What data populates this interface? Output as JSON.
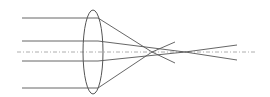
{
  "diagram": {
    "type": "optics-ray-diagram",
    "colors": {
      "background": "#ffffff",
      "ray": "#555555",
      "lens": "#555555",
      "axis": "#999999"
    },
    "axis": {
      "y": 52,
      "x1": 17,
      "x2": 256,
      "style": "dash-dot"
    },
    "lens": {
      "cx": 93,
      "cy": 52,
      "rx": 10,
      "ry": 42
    },
    "rays": [
      {
        "name": "outer-top",
        "y_in": 18,
        "x_lens": 98,
        "focus_x": 152,
        "end_x": 175,
        "end_y": 63
      },
      {
        "name": "inner-top",
        "y_in": 41,
        "x_lens": 98,
        "focus_x": 185,
        "end_x": 237,
        "end_y": 60
      },
      {
        "name": "inner-bottom",
        "y_in": 61,
        "x_lens": 98,
        "focus_x": 185,
        "end_x": 237,
        "end_y": 45
      },
      {
        "name": "outer-bottom",
        "y_in": 88,
        "x_lens": 98,
        "focus_x": 152,
        "end_x": 175,
        "end_y": 42
      }
    ],
    "ray_start_x": 22
  }
}
